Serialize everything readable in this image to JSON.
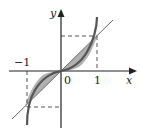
{
  "diagram": {
    "axes": {
      "x_label": "x",
      "y_label": "y",
      "origin_label": "0",
      "tick_pos_one": "1",
      "tick_neg_one": "−1"
    },
    "curves": [
      {
        "name": "cubic",
        "equation": "y = x^3",
        "stroke": "#555555"
      },
      {
        "name": "line",
        "equation": "y = x",
        "stroke": "#666666"
      }
    ],
    "shaded_region": {
      "between": [
        "y = x^3",
        "y = x"
      ],
      "x_range": [
        -1,
        1
      ],
      "fill": "#b0b0b0"
    },
    "guides": {
      "style": "dashed",
      "points": [
        [
          1,
          1
        ],
        [
          -1,
          -1
        ]
      ]
    },
    "colors": {
      "axis": "#222222",
      "curve": "#555555",
      "fill": "#b0b0b0",
      "dash": "#555555"
    }
  }
}
